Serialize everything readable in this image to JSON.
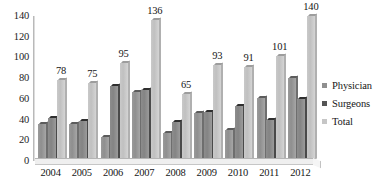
{
  "chart_data": {
    "type": "bar",
    "title": "",
    "xlabel": "",
    "ylabel": "",
    "ylim": [
      0,
      140
    ],
    "yticks": [
      0,
      20,
      40,
      60,
      80,
      100,
      120,
      140
    ],
    "grid": false,
    "legend_position": "right",
    "categories": [
      "2004",
      "2005",
      "2006",
      "2007",
      "2008",
      "2009",
      "2010",
      "2011",
      "2012"
    ],
    "series": [
      {
        "name": "Physician",
        "color": "#8f8f8f",
        "values": [
          36,
          36,
          23,
          67,
          27,
          46,
          30,
          61,
          80
        ]
      },
      {
        "name": "Surgeons",
        "color": "#555555",
        "values": [
          42,
          39,
          72,
          69,
          38,
          47,
          53,
          40,
          60
        ]
      },
      {
        "name": "Total",
        "color": "#c6c6c6",
        "values": [
          78,
          75,
          95,
          136,
          65,
          93,
          91,
          101,
          140
        ],
        "data_labels": true
      }
    ],
    "total_labels": [
      "78",
      "75",
      "95",
      "136",
      "65",
      "93",
      "91",
      "101",
      "140"
    ]
  },
  "legend": {
    "items": [
      {
        "label": "Physician",
        "swatch": "#8f8f8f"
      },
      {
        "label": "Surgeons",
        "swatch": "#555555"
      },
      {
        "label": "Total",
        "swatch": "#c6c6c6"
      }
    ]
  },
  "axes": {
    "y_tick_labels": [
      "140",
      "120",
      "100",
      "80",
      "60",
      "40",
      "20",
      "0"
    ],
    "x_tick_labels": [
      "2004",
      "2005",
      "2006",
      "2007",
      "2008",
      "2009",
      "2010",
      "2011",
      "2012"
    ]
  }
}
